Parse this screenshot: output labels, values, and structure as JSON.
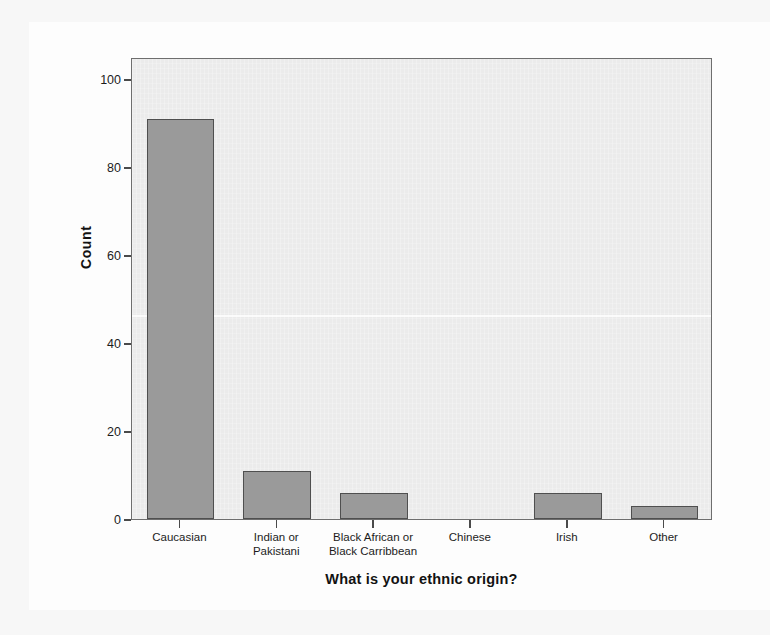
{
  "figure": {
    "background_color": "#fdfdfd",
    "plot_background_color": "#ebebeb",
    "axis_color": "#6e6e6e",
    "bar_fill_color": "#9a9a9a",
    "bar_border_color": "#4f4f4f"
  },
  "chart_data": {
    "type": "bar",
    "title": "",
    "xlabel": "What is your ethnic origin?",
    "ylabel": "Count",
    "categories": [
      "Caucasian",
      "Indian or\nPakistani",
      "Black African or\nBlack Carribbean",
      "Chinese",
      "Irish",
      "Other"
    ],
    "values": [
      91,
      11,
      6,
      0,
      6,
      3
    ],
    "ylim": [
      0,
      105
    ],
    "yticks": [
      0,
      20,
      40,
      60,
      80,
      100
    ],
    "ytick_labels": [
      "0",
      "20",
      "40",
      "60",
      "80",
      "100"
    ],
    "grid": false,
    "legend": null
  }
}
